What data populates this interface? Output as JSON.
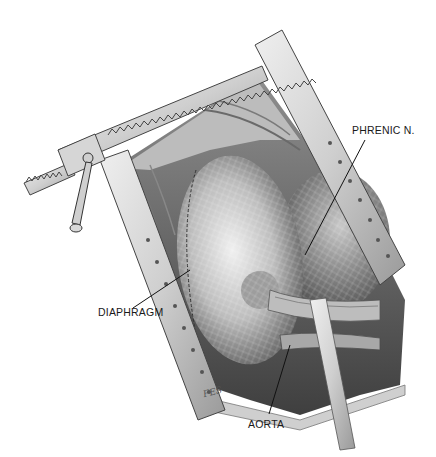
{
  "figure": {
    "style": "grayscale pencil medical illustration"
  },
  "labels": [
    {
      "id": "phrenic",
      "text": "PHRENIC N.",
      "x": 352,
      "y": 124
    },
    {
      "id": "diaphragm",
      "text": "DIAPHRAGM",
      "x": 98,
      "y": 306
    },
    {
      "id": "aorta",
      "text": "AORTA",
      "x": 248,
      "y": 418
    }
  ],
  "signature": {
    "text": "FES"
  },
  "colors": {
    "background": "#ffffff",
    "ink": "#1a1a1a",
    "retractor_light": "#d9d9d9",
    "retractor_dark": "#8a8a8a",
    "tissue_light": "#cfcfcf",
    "tissue_dark": "#5a5a5a"
  }
}
